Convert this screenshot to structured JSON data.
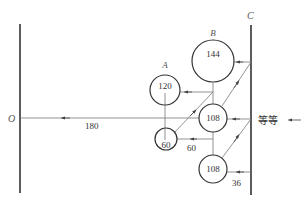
{
  "diagram": {
    "lines": {
      "left_label": "O",
      "right_label": "C"
    },
    "nodes": [
      {
        "id": "A",
        "label": "A",
        "value": "120"
      },
      {
        "id": "B",
        "label": "B",
        "value": "144"
      },
      {
        "id": "mid",
        "label": "",
        "value": "108"
      },
      {
        "id": "small",
        "label": "",
        "value": "60"
      },
      {
        "id": "bottom",
        "label": "",
        "value": "108"
      }
    ],
    "edge_labels": {
      "main_flow": "180",
      "small_to_mid": "60",
      "bottom_to_c": "36"
    },
    "input_label": "等等",
    "colors": {
      "stroke": "#333333",
      "thin": "#666666",
      "text": "#333333"
    }
  }
}
